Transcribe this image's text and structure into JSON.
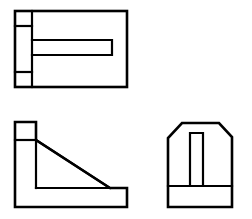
{
  "document": {
    "title": "Orthographic Three-View Drawing",
    "subject": "Angle bracket with slot",
    "projection": "third-angle",
    "canvas": {
      "width": 252,
      "height": 219
    },
    "background_color": "#ffffff",
    "line_color": "#000000",
    "line_weight_outline": 2.6,
    "line_weight_interior": 2.2,
    "visible_text": []
  },
  "views": {
    "top_view": {
      "name": "top-view",
      "label": "Top View",
      "outline": {
        "x": 15,
        "y": 11,
        "width": 112,
        "height": 76,
        "shape": "rectangle"
      },
      "features": [
        {
          "name": "left-edge-strip",
          "type": "vertical-line",
          "x": 32,
          "y1": 11,
          "y2": 87
        },
        {
          "name": "upper-divider",
          "type": "horizontal-line",
          "x1": 15,
          "x2": 32,
          "y": 26
        },
        {
          "name": "lower-divider",
          "type": "horizontal-line",
          "x1": 15,
          "x2": 32,
          "y": 72
        },
        {
          "name": "center-slot",
          "type": "rectangle-open-left",
          "x1": 32,
          "x2": 112,
          "y1": 40,
          "y2": 55
        }
      ]
    },
    "front_view": {
      "name": "front-view",
      "label": "Front View",
      "outline": {
        "shape": "l-bracket-with-gusset",
        "points": [
          [
            15,
            122
          ],
          [
            36,
            122
          ],
          [
            36,
            140
          ],
          [
            110,
            188
          ],
          [
            127,
            188
          ],
          [
            127,
            207
          ],
          [
            15,
            207
          ]
        ]
      },
      "features": [
        {
          "name": "upper-block-divider",
          "type": "horizontal-line",
          "x1": 15,
          "x2": 36,
          "y": 140
        },
        {
          "name": "base-plate-top",
          "type": "horizontal-line",
          "x1": 36,
          "x2": 110,
          "y": 188
        },
        {
          "name": "vertical-wall-right",
          "type": "vertical-line",
          "x": 36,
          "y1": 140,
          "y2": 188
        },
        {
          "name": "diagonal-gusset",
          "type": "diagonal-line",
          "x1": 36,
          "y1": 140,
          "x2": 110,
          "y2": 188
        }
      ]
    },
    "side_view": {
      "name": "side-view",
      "label": "Right Side View",
      "outline": {
        "shape": "chamfered-octagon",
        "points": [
          [
            168,
            207
          ],
          [
            168,
            138
          ],
          [
            182,
            123
          ],
          [
            219,
            123
          ],
          [
            232,
            137
          ],
          [
            232,
            207
          ]
        ]
      },
      "features": [
        {
          "name": "base-divider",
          "type": "horizontal-line",
          "x1": 168,
          "x2": 232,
          "y": 186
        },
        {
          "name": "center-slot",
          "type": "rectangle-open-bottom",
          "x1": 190,
          "x2": 203,
          "y1": 133,
          "y2": 186
        }
      ]
    }
  }
}
